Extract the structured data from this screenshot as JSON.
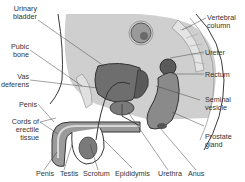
{
  "diagram": {
    "colors": {
      "background": "#ffffff",
      "abdomen": "#c8c8c8",
      "bladder": "#6e6e6e",
      "organ_dark": "#5a5a5a",
      "organ_mid": "#8a8a8a",
      "tissue_light": "#dcdcdc",
      "outline": "#3a3a3a",
      "text": "#333333"
    },
    "labels": {
      "urinary_bladder": "Urinary\nbladder",
      "pubic_bone": "Pubic\nbone",
      "vas_deferens": "Vas\ndeferens",
      "penis_left": "Penis",
      "cords_erectile": "Cords of\nerectile\ntissue",
      "vertebral_column": "Vertebral\ncolumn",
      "ureter": "Ureter",
      "rectum": "Rectum",
      "seminal_vesicle": "Seminal\nvesicle",
      "prostate_gland": "Prostate\ngland",
      "penis_bottom": "Penis",
      "testis": "Testis",
      "scrotum": "Scrotum",
      "epididymis": "Epididymis",
      "urethra": "Urethra",
      "anus": "Anus"
    }
  }
}
